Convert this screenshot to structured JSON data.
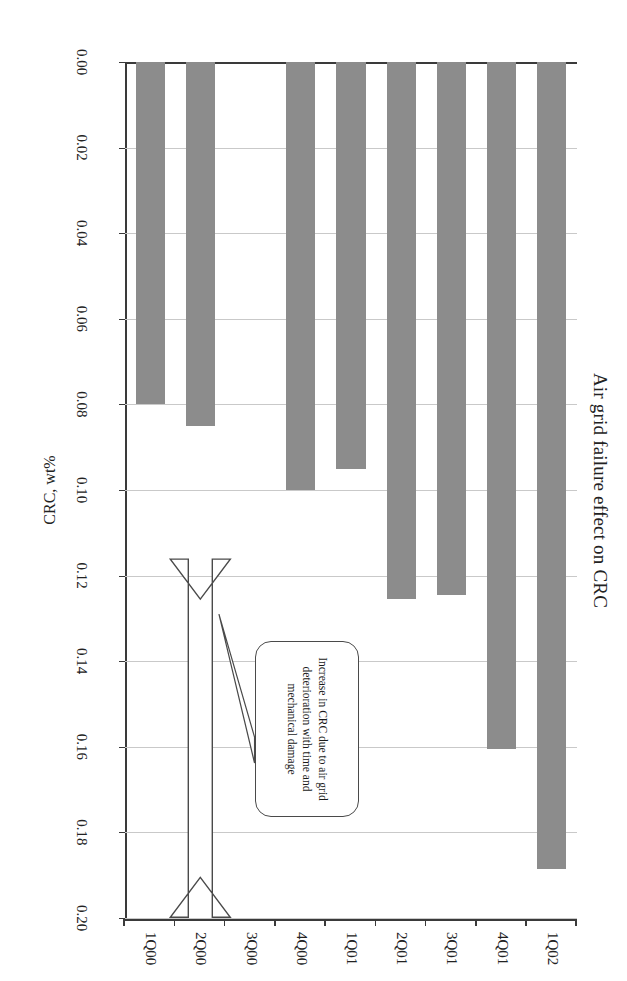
{
  "chart": {
    "title": "Air grid failure effect on CRC",
    "value_axis_title": "CRC, wt%"
  },
  "annotation": {
    "callout_text": "Increase in CRC due to air grid deterioration with time and mechanical damage",
    "arrow_name": "double-headed-arrow"
  },
  "chart_data": {
    "type": "bar",
    "orientation": "horizontal",
    "title": "Air grid failure effect on CRC",
    "xlabel": "",
    "ylabel": "CRC, wt%",
    "categories": [
      "1Q00",
      "2Q00",
      "3Q00",
      "4Q00",
      "1Q01",
      "2Q01",
      "3Q01",
      "4Q01",
      "1Q02"
    ],
    "values": [
      0.08,
      0.085,
      0.0,
      0.1,
      0.095,
      0.1255,
      0.1245,
      0.1605,
      0.1885
    ],
    "ylim": [
      0.0,
      0.2
    ],
    "ytick_labels": [
      "0.20",
      "0.18",
      "0.16",
      "0.14",
      "0.12",
      "0.10",
      "0.08",
      "0.06",
      "0.04",
      "0.02",
      "0.00"
    ],
    "ytick_values": [
      0.2,
      0.18,
      0.16,
      0.14,
      0.12,
      0.1,
      0.08,
      0.06,
      0.04,
      0.02,
      0.0
    ],
    "grid": true,
    "legend": false,
    "bar_color": "#8c8c8c",
    "annotations": [
      {
        "text": "Increase in CRC due to air grid deterioration with time and mechanical damage",
        "shape": "rounded-callout"
      }
    ]
  }
}
